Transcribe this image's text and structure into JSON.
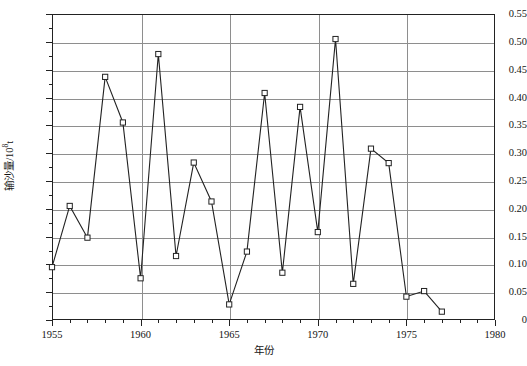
{
  "chart_data": {
    "type": "line",
    "title": "",
    "subtitle": "",
    "xlabel": "年份",
    "ylabel": "输沙量/10⁸t",
    "ylabel_base": "输沙量/10",
    "ylabel_exponent": "8",
    "ylabel_unit": "t",
    "xlim": [
      1955,
      1980
    ],
    "ylim": [
      0,
      0.55
    ],
    "grid": "horizontal-and-major-vertical",
    "legend": "none",
    "marker": "open-square",
    "line_color": "#222222",
    "grid_color": "#8e8e8e",
    "axis_color": "#222222",
    "x_major_step": 5,
    "x_minor_step": 1,
    "y_major_step": 0.05,
    "y_minor_step": 0.025,
    "xticks": [
      1955,
      1960,
      1965,
      1970,
      1975,
      1980
    ],
    "xtick_labels": [
      "1955",
      "1960",
      "1965",
      "1970",
      "1975",
      "1980"
    ],
    "yticks": [
      0,
      0.05,
      0.1,
      0.15,
      0.2,
      0.25,
      0.3,
      0.35,
      0.4,
      0.45,
      0.5,
      0.55
    ],
    "ytick_labels": [
      "0",
      "0.05",
      "0.10",
      "0.15",
      "0.20",
      "0.25",
      "0.30",
      "0.35",
      "0.40",
      "0.45",
      "0.50",
      "0.55"
    ],
    "x": [
      1955,
      1956,
      1957,
      1958,
      1959,
      1960,
      1961,
      1962,
      1963,
      1964,
      1965,
      1966,
      1967,
      1968,
      1969,
      1970,
      1971,
      1972,
      1973,
      1974,
      1975,
      1976,
      1977
    ],
    "values": [
      0.095,
      0.205,
      0.148,
      0.437,
      0.355,
      0.075,
      0.478,
      0.115,
      0.283,
      0.213,
      0.028,
      0.123,
      0.408,
      0.085,
      0.383,
      0.158,
      0.505,
      0.065,
      0.308,
      0.282,
      0.042,
      0.052,
      0.015
    ],
    "series": [
      {
        "name": "输沙量",
        "values": [
          0.095,
          0.205,
          0.148,
          0.437,
          0.355,
          0.075,
          0.478,
          0.115,
          0.283,
          0.213,
          0.028,
          0.123,
          0.408,
          0.085,
          0.383,
          0.158,
          0.505,
          0.065,
          0.308,
          0.282,
          0.042,
          0.052,
          0.015
        ]
      }
    ]
  }
}
